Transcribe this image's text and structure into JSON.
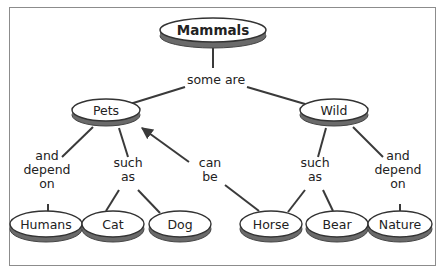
{
  "diagram": {
    "type": "concept-map",
    "colors": {
      "frame": "#8c8c8c",
      "edge": "#3a3a3a",
      "oval_face": "#ffffff",
      "oval_shadow": "#6a6a6a",
      "text": "#222222"
    },
    "nodes": {
      "mammals": {
        "label": "Mammals",
        "cx": 213,
        "cy": 30,
        "rx": 53,
        "ry": 12
      },
      "pets": {
        "label": "Pets",
        "cx": 106,
        "cy": 110,
        "rx": 34,
        "ry": 11
      },
      "wild": {
        "label": "Wild",
        "cx": 334,
        "cy": 110,
        "rx": 34,
        "ry": 11
      },
      "humans": {
        "label": "Humans",
        "cx": 46,
        "cy": 224,
        "rx": 36,
        "ry": 13
      },
      "cat": {
        "label": "Cat",
        "cx": 113,
        "cy": 224,
        "rx": 31,
        "ry": 13
      },
      "dog": {
        "label": "Dog",
        "cx": 180,
        "cy": 224,
        "rx": 31,
        "ry": 13
      },
      "horse": {
        "label": "Horse",
        "cx": 271,
        "cy": 224,
        "rx": 31,
        "ry": 13
      },
      "bear": {
        "label": "Bear",
        "cx": 337,
        "cy": 224,
        "rx": 31,
        "ry": 13
      },
      "nature": {
        "label": "Nature",
        "cx": 400,
        "cy": 224,
        "rx": 32,
        "ry": 13
      }
    },
    "link_labels": {
      "some_are": {
        "lines": [
          "some are"
        ],
        "x": 216,
        "y": 80
      },
      "pets_depend": {
        "lines": [
          "and",
          "depend",
          "on"
        ],
        "x": 47,
        "y": 170
      },
      "pets_such": {
        "lines": [
          "such",
          "as"
        ],
        "x": 128,
        "y": 170
      },
      "can_be": {
        "lines": [
          "can",
          "be"
        ],
        "x": 210,
        "y": 170
      },
      "wild_such": {
        "lines": [
          "such",
          "as"
        ],
        "x": 315,
        "y": 170
      },
      "wild_depend": {
        "lines": [
          "and",
          "depend",
          "on"
        ],
        "x": 398,
        "y": 170
      }
    },
    "edges": [
      {
        "from": "mammals",
        "to": "some_are",
        "points": [
          [
            213,
            48
          ],
          [
            213,
            68
          ]
        ]
      },
      {
        "from": "some_are",
        "to": "pets",
        "points": [
          [
            185,
            87
          ],
          [
            130,
            104
          ]
        ]
      },
      {
        "from": "some_are",
        "to": "wild",
        "points": [
          [
            247,
            87
          ],
          [
            305,
            104
          ]
        ]
      },
      {
        "from": "pets",
        "to": "pets_depend",
        "points": [
          [
            93,
            127
          ],
          [
            62,
            157
          ]
        ]
      },
      {
        "from": "pets",
        "to": "pets_such",
        "points": [
          [
            119,
            128
          ],
          [
            128,
            157
          ]
        ]
      },
      {
        "from": "can_be",
        "to": "pets",
        "points": [
          [
            189,
            162
          ],
          [
            142,
            128
          ]
        ],
        "arrow": true
      },
      {
        "from": "wild",
        "to": "wild_such",
        "points": [
          [
            326,
            128
          ],
          [
            318,
            157
          ]
        ]
      },
      {
        "from": "wild",
        "to": "wild_depend",
        "points": [
          [
            353,
            127
          ],
          [
            383,
            157
          ]
        ]
      },
      {
        "from": "pets_depend",
        "to": "humans",
        "points": [
          [
            48,
            204
          ],
          [
            48,
            212
          ]
        ]
      },
      {
        "from": "pets_such",
        "to": "cat",
        "points": [
          [
            119,
            190
          ],
          [
            106,
            211
          ]
        ]
      },
      {
        "from": "pets_such",
        "to": "dog",
        "points": [
          [
            138,
            190
          ],
          [
            160,
            213
          ]
        ]
      },
      {
        "from": "can_be",
        "to": "horse",
        "points": [
          [
            225,
            185
          ],
          [
            259,
            211
          ]
        ]
      },
      {
        "from": "wild_such",
        "to": "horse",
        "points": [
          [
            305,
            190
          ],
          [
            288,
            212
          ]
        ]
      },
      {
        "from": "wild_such",
        "to": "bear",
        "points": [
          [
            323,
            190
          ],
          [
            333,
            211
          ]
        ]
      },
      {
        "from": "wild_depend",
        "to": "nature",
        "points": [
          [
            400,
            204
          ],
          [
            400,
            212
          ]
        ]
      }
    ]
  }
}
